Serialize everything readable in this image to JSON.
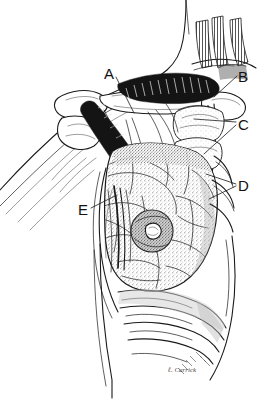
{
  "figure": {
    "background_color": "#ffffff",
    "ink_color": "#1a1a1a",
    "style": "pen-and-ink stipple medical illustration",
    "width": 265,
    "height": 406
  },
  "labels": [
    {
      "id": "A",
      "text": "A",
      "x": 110,
      "y": 74,
      "leader": {
        "x1": 116,
        "y1": 77,
        "x2": 134,
        "y2": 113
      }
    },
    {
      "id": "B",
      "text": "B",
      "x": 240,
      "y": 78,
      "leader": {
        "x1": 237,
        "y1": 78,
        "x2": 214,
        "y2": 97
      }
    },
    {
      "id": "C",
      "text": "C",
      "x": 240,
      "y": 128,
      "leader": {
        "x1": 236,
        "y1": 124,
        "x2": 196,
        "y2": 120
      }
    },
    {
      "id": "C2",
      "text": "",
      "x": 0,
      "y": 0,
      "leader": {
        "x1": 236,
        "y1": 126,
        "x2": 205,
        "y2": 152
      }
    },
    {
      "id": "D",
      "text": "D",
      "x": 240,
      "y": 190,
      "leader": {
        "x1": 236,
        "y1": 185,
        "x2": 206,
        "y2": 176
      }
    },
    {
      "id": "D2",
      "text": "",
      "x": 0,
      "y": 0,
      "leader": {
        "x1": 236,
        "y1": 187,
        "x2": 210,
        "y2": 198
      }
    },
    {
      "id": "E",
      "text": "E",
      "x": 80,
      "y": 214,
      "leader": {
        "x1": 91,
        "y1": 209,
        "x2": 117,
        "y2": 196
      }
    }
  ],
  "signature": {
    "text": "ℓ. Carrick",
    "x": 172,
    "y": 372
  },
  "colors": {
    "ink": "#1a1a1a",
    "shadow": "#6e6e6e",
    "tint": "#d8d8d8",
    "paper": "#ffffff"
  }
}
